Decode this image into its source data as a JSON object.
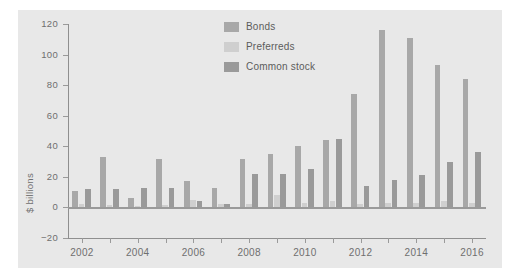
{
  "chart_data": {
    "type": "bar",
    "title": "",
    "subtitle": "",
    "xlabel": "",
    "ylabel": "$ billions",
    "ylim": [
      -20,
      120
    ],
    "ytick_values": [
      -20,
      0,
      20,
      40,
      60,
      80,
      100,
      120
    ],
    "ytick_labels": [
      "−20",
      "0",
      "20",
      "40",
      "60",
      "80",
      "100",
      "120"
    ],
    "grid": false,
    "legend_position": "top-right",
    "categories": [
      "2002",
      "2003",
      "2004",
      "2005",
      "2006",
      "2007",
      "2008",
      "2009",
      "2010",
      "2011",
      "2012",
      "2013",
      "2014",
      "2015",
      "2016"
    ],
    "xtick_labels": [
      "2002",
      "",
      "2004",
      "",
      "2006",
      "",
      "2008",
      "",
      "2010",
      "",
      "2012",
      "",
      "2014",
      "",
      "2016"
    ],
    "series": [
      {
        "name": "Bonds",
        "color": "#a8a8a8",
        "values": [
          11,
          33,
          6,
          32,
          17,
          13,
          32,
          35,
          40,
          44,
          74,
          116,
          111,
          93,
          84
        ]
      },
      {
        "name": "Preferreds",
        "color": "#cfcfcf",
        "values": [
          2,
          1.5,
          1,
          1.5,
          5,
          2,
          2,
          8,
          3,
          4,
          2,
          3,
          3,
          4,
          3
        ]
      },
      {
        "name": "Common stock",
        "color": "#9a9a9a",
        "values": [
          12,
          12,
          13,
          13,
          4,
          2,
          22,
          22,
          25,
          45,
          14,
          18,
          21,
          30,
          36
        ]
      }
    ]
  },
  "legend": {
    "items": [
      {
        "label": "Bonds",
        "swatch": "legend-swatch-bonds"
      },
      {
        "label": "Preferreds",
        "swatch": "legend-swatch-preferreds"
      },
      {
        "label": "Common stock",
        "swatch": "legend-swatch-common-stock"
      }
    ]
  },
  "axes": {
    "y_title": "$ billions"
  },
  "colors": {
    "figure_background": "#ffffff",
    "panel_background": "#e8e8e8",
    "axis": "#8f8f8f",
    "tick_text": "#6f6f6f",
    "legend_text": "#5c5c5c",
    "bonds": "#a8a8a8",
    "preferreds": "#cfcfcf",
    "common_stock": "#9a9a9a"
  }
}
